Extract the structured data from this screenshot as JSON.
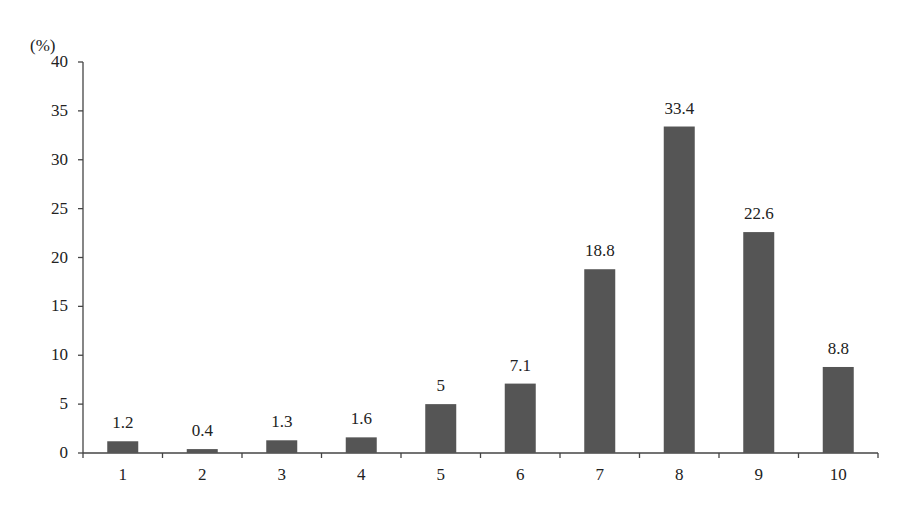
{
  "chart_data": {
    "type": "bar",
    "title": "",
    "xlabel": "",
    "ylabel": "(%)",
    "categories": [
      "1",
      "2",
      "3",
      "4",
      "5",
      "6",
      "7",
      "8",
      "9",
      "10"
    ],
    "values": [
      1.2,
      0.4,
      1.3,
      1.6,
      5,
      7.1,
      18.8,
      33.4,
      22.6,
      8.8
    ],
    "value_labels": [
      "1.2",
      "0.4",
      "1.3",
      "1.6",
      "5",
      "7.1",
      "18.8",
      "33.4",
      "22.6",
      "8.8"
    ],
    "ylim": [
      0,
      40
    ],
    "yticks": [
      "0",
      "5",
      "10",
      "15",
      "20",
      "25",
      "30",
      "35",
      "40"
    ],
    "grid": false,
    "legend": null,
    "bar_color": "#555555"
  }
}
